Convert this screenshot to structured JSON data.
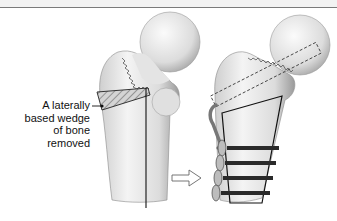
{
  "header": {
    "rule_color": "#7a7a7a",
    "trailing_glyphs": "’ ʼ"
  },
  "diagram": {
    "title": "",
    "annotation": {
      "lines": [
        "A laterally",
        "based wedge",
        "of bone",
        "removed"
      ]
    },
    "panels": [
      {
        "id": "before",
        "subject": "proximal-femur",
        "features": [
          "femoral-head",
          "neck-fracture-line",
          "hatched-lateral-wedge",
          "vertical-cut-line"
        ]
      },
      {
        "id": "after",
        "subject": "proximal-femur-fixed",
        "features": [
          "femoral-head",
          "neck-fracture-line",
          "dashed-screw-outline",
          "trapezoid-plate-outline",
          "four-transverse-screws",
          "lateral-side-plate"
        ]
      }
    ],
    "arrow": {
      "direction": "right",
      "meaning": "transition-before-to-after"
    },
    "colors": {
      "bone_fill": "#e6e6e6",
      "bone_shadow": "#b8b8b8",
      "outline": "#222222",
      "hatch": "#555555",
      "screw": "#2a2a2a"
    }
  }
}
